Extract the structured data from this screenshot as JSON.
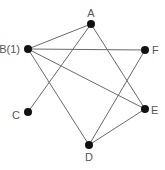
{
  "graph": {
    "nodes": [
      {
        "id": "A",
        "label": "A",
        "x": 91,
        "y": 24,
        "lx": 91,
        "ly": 17,
        "anchor": "middle"
      },
      {
        "id": "B",
        "label": "B(1)",
        "x": 28,
        "y": 49,
        "lx": 20,
        "ly": 53,
        "anchor": "end"
      },
      {
        "id": "F",
        "label": "F",
        "x": 145,
        "y": 50,
        "lx": 152,
        "ly": 54,
        "anchor": "start"
      },
      {
        "id": "E",
        "label": "E",
        "x": 145,
        "y": 109,
        "lx": 151,
        "ly": 114,
        "anchor": "start"
      },
      {
        "id": "C",
        "label": "C",
        "x": 28,
        "y": 112,
        "lx": 20,
        "ly": 119,
        "anchor": "end"
      },
      {
        "id": "D",
        "label": "D",
        "x": 89,
        "y": 145,
        "lx": 89,
        "ly": 161,
        "anchor": "middle"
      }
    ],
    "edges": [
      [
        "A",
        "B"
      ],
      [
        "A",
        "C"
      ],
      [
        "A",
        "E"
      ],
      [
        "B",
        "F"
      ],
      [
        "B",
        "E"
      ],
      [
        "B",
        "D"
      ],
      [
        "F",
        "D"
      ],
      [
        "D",
        "E"
      ]
    ]
  }
}
